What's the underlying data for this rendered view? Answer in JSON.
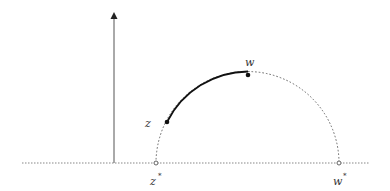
{
  "diagram": {
    "type": "upper-half-plane geodesic",
    "labels": {
      "z": "z",
      "w": "w",
      "z_star": "z",
      "w_star": "w",
      "star": "*"
    },
    "points": {
      "z": {
        "x": 167,
        "y": 122
      },
      "w": {
        "x": 248,
        "y": 75
      },
      "z_star": {
        "x": 156,
        "y": 163
      },
      "w_star": {
        "x": 339,
        "y": 163
      }
    },
    "colors": {
      "axis": "#555555",
      "baseline": "#888888",
      "solid_arc": "#111111",
      "dotted_arc": "#666666"
    }
  }
}
